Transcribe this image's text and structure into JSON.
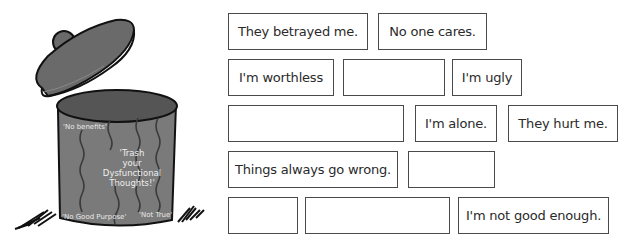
{
  "illustration": {
    "name": "trash-can",
    "labels": {
      "top_left": "'No benefits'",
      "center_lines": [
        "'Trash",
        "your",
        "Dysfunctional",
        "Thoughts!'"
      ],
      "bottom_left": "'No Good Purpose'",
      "bottom_right": "'Not True'"
    },
    "colors": {
      "can_body": "#7a7a7a",
      "can_dark": "#555555",
      "lid": "#6a6a6a",
      "outline": "#111111"
    }
  },
  "thought_boxes": [
    {
      "text": "They betrayed me."
    },
    {
      "text": "No one cares."
    },
    {
      "text": "I'm worthless"
    },
    {
      "text": ""
    },
    {
      "text": "I'm ugly"
    },
    {
      "text": ""
    },
    {
      "text": "I'm alone."
    },
    {
      "text": "They hurt me."
    },
    {
      "text": "Things always go wrong."
    },
    {
      "text": ""
    },
    {
      "text": ""
    },
    {
      "text": ""
    },
    {
      "text": "I'm not good enough."
    }
  ]
}
